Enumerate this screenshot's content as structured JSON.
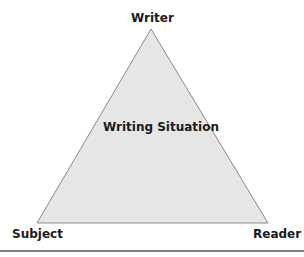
{
  "diagram": {
    "title": "Writing Situation",
    "vertices": {
      "top": "Writer",
      "bottom_left": "Subject",
      "bottom_right": "Reader"
    },
    "center_label": "Writing Situation",
    "colors": {
      "fill": "#e6e6e6",
      "stroke": "#8a8a8a",
      "rule": "#555555"
    }
  }
}
